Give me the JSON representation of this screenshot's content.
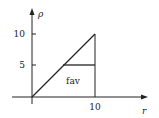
{
  "diagram": {
    "axes": {
      "x_label": "r",
      "y_label": "ρ",
      "x_ticks": [
        {
          "value": 10,
          "label": "10"
        }
      ],
      "y_ticks": [
        {
          "value": 5,
          "label": "5"
        },
        {
          "value": 10,
          "label": "10"
        }
      ]
    },
    "region_label": "fav",
    "lines": [
      {
        "name": "diagonal",
        "from": [
          0,
          0
        ],
        "to": [
          10,
          10
        ]
      },
      {
        "name": "vertical-at-10",
        "from": [
          10,
          0
        ],
        "to": [
          10,
          10
        ]
      },
      {
        "name": "horizontal-at-5",
        "from": [
          5,
          5
        ],
        "to": [
          10,
          5
        ]
      }
    ],
    "colors": {
      "stroke": "#222222",
      "background": "#ffffff"
    }
  }
}
